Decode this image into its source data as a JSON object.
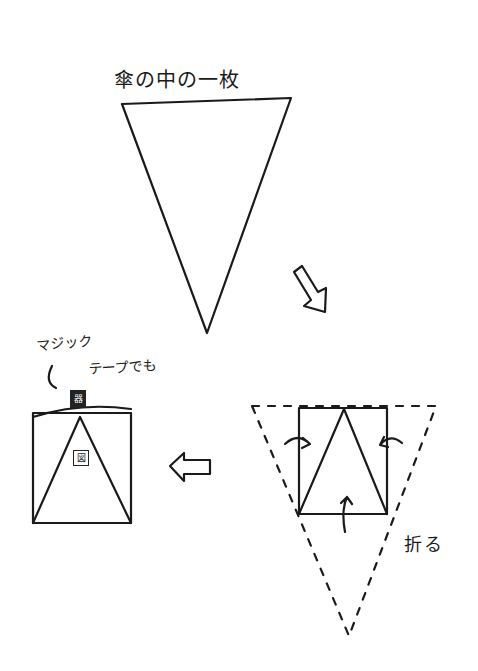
{
  "title": "傘の中の一枚",
  "tape_note": {
    "line1": "マジック",
    "line2": "テープでも"
  },
  "fold_label": "折る",
  "stamps": {
    "top": "器",
    "center": "図"
  },
  "colors": {
    "ink": "#1a1a1a",
    "background": "#ffffff"
  }
}
